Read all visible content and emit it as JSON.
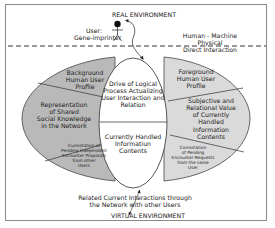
{
  "diagram": {
    "top_label": "REAL ENVIRONMENT",
    "bottom_label": "VIRTUAL ENVIRONMENT",
    "user": {
      "line1": "User:",
      "line2": "Gene-imprinter"
    },
    "interface_label": {
      "line1": "Human - Machine",
      "line2": "Physical",
      "line3": "Direct Interaction"
    },
    "center": {
      "top": [
        "Drive of Logical",
        "Process Actualizing",
        "User Interaction and",
        "Relation"
      ],
      "bottom": [
        "Currently Handled",
        "Informatiun",
        "Contents"
      ]
    },
    "left_segments": [
      {
        "lines": [
          "Background",
          "Human User",
          "Profile"
        ]
      },
      {
        "lines": [
          "Representation",
          "of Shared",
          "Social Knowledge",
          "in the Network"
        ]
      },
      {
        "lines": [
          "Cunnotation of",
          "Pending Independent",
          "Encounter Proposals",
          "from other",
          "Users"
        ]
      }
    ],
    "right_segments": [
      {
        "lines": [
          "Foreground",
          "Human User",
          "Profile"
        ]
      },
      {
        "lines": [
          "Subjective and",
          "Relational Value",
          "of Currently",
          "Handled",
          "Information",
          "Contents"
        ]
      },
      {
        "lines": [
          "Connotation",
          "of Pending",
          "Encounter Requests",
          "from the same",
          "User"
        ]
      }
    ],
    "bottom_text": {
      "line1": "Related Current Interactions through",
      "line2": "the Network with other Users"
    },
    "colors": {
      "left_fill": "#b9b9b9",
      "right_fill": "#dadada",
      "center_fill": "#ffffff",
      "stroke": "#333333"
    }
  }
}
